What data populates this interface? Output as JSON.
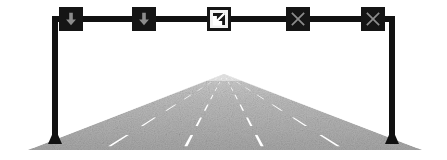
{
  "scene": {
    "title": "Highway lane control signal gantry over roadway",
    "background_color": "#ffffff",
    "width": 447,
    "height": 160
  },
  "gantry": {
    "name": "lane-control-gantry",
    "structure_color": "#111111",
    "beam": {
      "label": "Overhead gantry beam",
      "x": 52,
      "y": 16,
      "width": 343,
      "height": 6
    },
    "left_post": {
      "label": "Left gantry post",
      "x": 52,
      "y": 16,
      "width": 6,
      "height": 128
    },
    "right_post": {
      "label": "Right gantry post",
      "x": 389,
      "y": 16,
      "width": 6,
      "height": 128
    },
    "base_color": "#111111"
  },
  "signals": [
    {
      "id": "lane-signal-1",
      "label": "Lane 1",
      "icon": "down-arrow-icon",
      "meaning": "Lane open",
      "symbol_color": "#8c8c8c",
      "panel_color": "#151515",
      "center_x": 71,
      "center_y": 19,
      "size": 24
    },
    {
      "id": "lane-signal-2",
      "label": "Lane 2",
      "icon": "down-arrow-icon",
      "meaning": "Lane open",
      "symbol_color": "#8c8c8c",
      "panel_color": "#151515",
      "center_x": 144,
      "center_y": 19,
      "size": 24
    },
    {
      "id": "lane-signal-3",
      "label": "Lane 3",
      "icon": "diagonal-merge-arrow-icon",
      "meaning": "Merge left",
      "symbol_color": "#ffffff",
      "panel_color": "#f2f2f2",
      "center_x": 219,
      "center_y": 19,
      "size": 24
    },
    {
      "id": "lane-signal-4",
      "label": "Lane 4",
      "icon": "x-cross-icon",
      "meaning": "Lane closed",
      "symbol_color": "#8c8c8c",
      "panel_color": "#151515",
      "center_x": 298,
      "center_y": 19,
      "size": 24
    },
    {
      "id": "lane-signal-5",
      "label": "Lane 5",
      "icon": "x-cross-icon",
      "meaning": "Lane closed",
      "symbol_color": "#8c8c8c",
      "panel_color": "#151515",
      "center_x": 373,
      "center_y": 19,
      "size": 24
    }
  ],
  "road": {
    "name": "perspective-roadway",
    "surface_color": "#a8a8a8",
    "surface_color_far": "#d0d0d0",
    "marking_color": "#ffffff",
    "horizon_y": 74,
    "vanishing_point_x": 224,
    "bottom_y": 148,
    "bottom_left_x": 30,
    "bottom_right_x": 420,
    "edge_line_label": "Solid white edge line",
    "lane_line_label": "Dashed white lane line",
    "lane_line_count": 4,
    "lane_count": 5,
    "lane_line_offsets": [
      -0.6,
      -0.2,
      0.2,
      0.6
    ]
  }
}
